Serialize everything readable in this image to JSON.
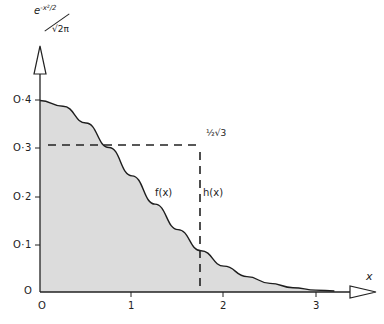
{
  "chart_data": {
    "type": "area",
    "title": "",
    "ylabel": "e^(-x²/2) / √(2π)",
    "xlabel": "x",
    "x_ticks": [
      "0",
      "1",
      "2",
      "3"
    ],
    "y_ticks": [
      "0",
      "0.1",
      "0.2",
      "0.3",
      "0.4"
    ],
    "xlim": [
      0,
      3.6
    ],
    "ylim": [
      0,
      0.4
    ],
    "grid": false,
    "legend": null,
    "series": [
      {
        "name": "f(x)",
        "x": [
          0,
          0.25,
          0.5,
          0.75,
          1.0,
          1.25,
          1.5,
          1.75,
          2.0,
          2.25,
          2.5,
          2.75,
          3.0,
          3.2
        ],
        "values": [
          0.399,
          0.387,
          0.352,
          0.301,
          0.242,
          0.183,
          0.13,
          0.086,
          0.054,
          0.032,
          0.018,
          0.009,
          0.004,
          0.002
        ],
        "filled": true
      }
    ],
    "annotations": [
      {
        "type": "hline-dashed",
        "y": 0.306,
        "x_from": 0,
        "x_to": 1.732,
        "label": "½√3"
      },
      {
        "type": "vline-dashed",
        "x": 1.732,
        "y_from": 0,
        "y_to": 0.306,
        "label": "h(x)"
      },
      {
        "type": "text",
        "label": "f(x)",
        "x": 1.25,
        "y": 0.2
      }
    ]
  },
  "labels": {
    "y_axis_num": "e",
    "y_axis_exp": "-x²/2",
    "y_axis_den": "√2π",
    "x_axis": "x",
    "origin_x": "O",
    "y_ticks": [
      "O·4",
      "O·3",
      "O·2",
      "O·1",
      "O"
    ],
    "x_ticks": [
      "O",
      "1",
      "2",
      "3"
    ],
    "f_label": "f(x)",
    "h_label": "h(x)",
    "sqrt_label": "½√3"
  },
  "colors": {
    "fill": "#dcdcdc",
    "line": "#1e1e1e"
  }
}
